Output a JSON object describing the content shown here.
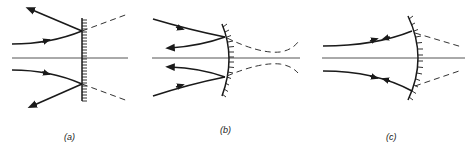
{
  "figure": {
    "panels": [
      {
        "id": "a",
        "label": "(a)",
        "mirror": "plane"
      },
      {
        "id": "b",
        "label": "(b)",
        "mirror": "convex"
      },
      {
        "id": "c",
        "label": "(c)",
        "mirror": "concave"
      }
    ]
  },
  "colors": {
    "ink": "#1a1a1a",
    "axis": "#555555",
    "background": "#ffffff"
  }
}
